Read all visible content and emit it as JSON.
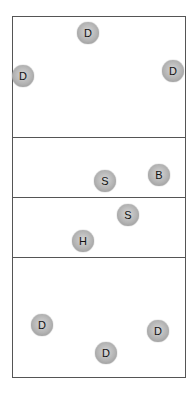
{
  "court": {
    "left": 12,
    "top": 16,
    "width": 174,
    "height": 362,
    "line_color": "#555555"
  },
  "lines": [
    {
      "y": 137
    },
    {
      "y": 197
    },
    {
      "y": 257
    }
  ],
  "players": [
    {
      "label": "D",
      "x": 88,
      "y": 33
    },
    {
      "label": "D",
      "x": 23,
      "y": 76
    },
    {
      "label": "D",
      "x": 173,
      "y": 71
    },
    {
      "label": "S",
      "x": 105,
      "y": 181
    },
    {
      "label": "B",
      "x": 159,
      "y": 175
    },
    {
      "label": "S",
      "x": 128,
      "y": 215
    },
    {
      "label": "H",
      "x": 83,
      "y": 241
    },
    {
      "label": "D",
      "x": 42,
      "y": 325
    },
    {
      "label": "D",
      "x": 158,
      "y": 331
    },
    {
      "label": "D",
      "x": 106,
      "y": 353
    }
  ]
}
